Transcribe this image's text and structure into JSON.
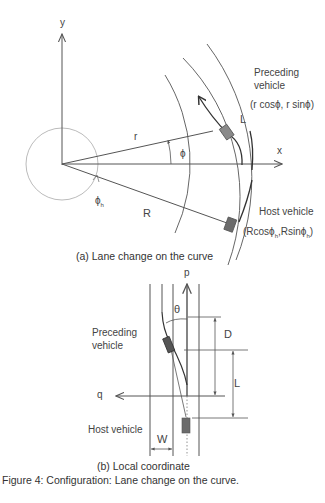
{
  "panel_a": {
    "axis_y_label": "y",
    "axis_x_label": "x",
    "radius_small_label": "r",
    "radius_large_label": "R",
    "angle_label": "ϕ",
    "host_angle_label": "ϕ",
    "host_angle_sub": "h",
    "gap_label": "L",
    "preceding_label_line1": "Preceding",
    "preceding_label_line2": "vehicle",
    "preceding_coords": "(r cosϕ, r sinϕ)",
    "host_label": "Host vehicle",
    "host_coords_prefix": "(Rcosϕ",
    "host_coords_mid": ",Rsinϕ",
    "host_coords_sub": "h",
    "host_coords_suffix": ")",
    "caption": "(a) Lane change on the curve"
  },
  "panel_b": {
    "axis_p_label": "p",
    "axis_q_label": "q",
    "theta_label": "θ",
    "distance_label": "D",
    "gap_label": "L",
    "width_label": "W",
    "preceding_label_line1": "Preceding",
    "preceding_label_line2": "vehicle",
    "host_label": "Host vehicle",
    "caption": "(b) Local coordinate"
  },
  "figure_caption": "Figure 4: Configuration: Lane change on the curve.",
  "colors": {
    "line": "#555555",
    "vehicle": "#6b6b6b",
    "light_line": "#aaaaaa"
  }
}
